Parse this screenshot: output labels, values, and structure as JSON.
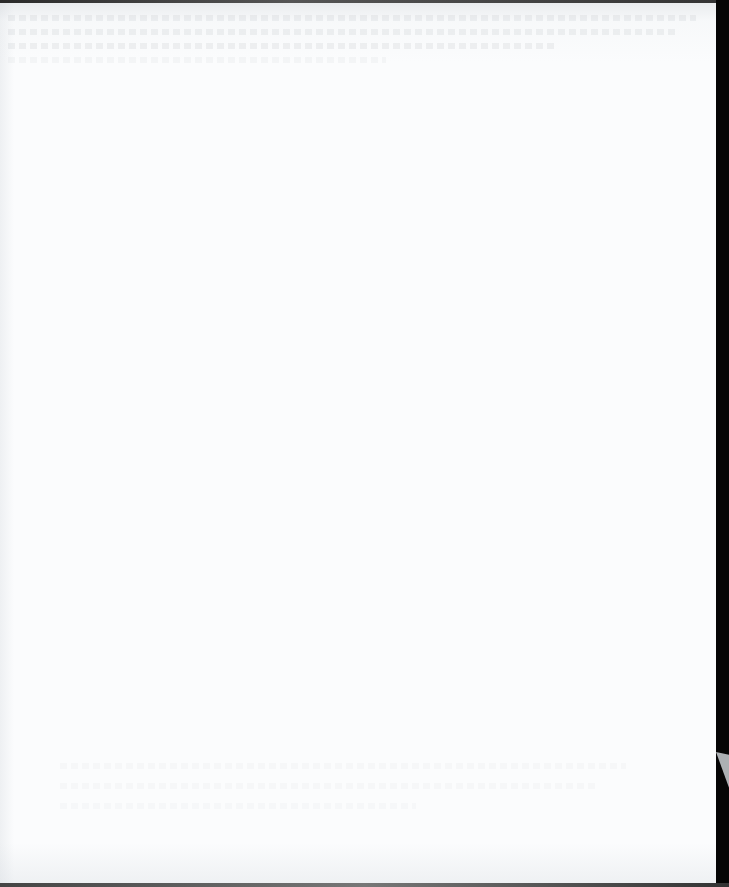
{
  "document": {
    "type": "scanned-page",
    "content": "blank",
    "legible_text": [],
    "colors": {
      "paper": "#fbfcfd",
      "scanner_background": "#0a0a0a",
      "corner_wedge": "#bfc3c6"
    }
  }
}
